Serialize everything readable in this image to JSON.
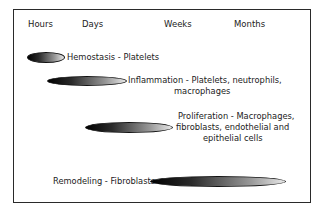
{
  "timeline": {
    "labels": [
      "Hours",
      "Days",
      "Weeks",
      "Months"
    ]
  },
  "phases": [
    {
      "name": "Hemostasis",
      "cells": "Platelets",
      "lines": [
        "Hemostasis - Platelets"
      ]
    },
    {
      "name": "Inflammation",
      "cells": "Platelets, neutrophils, macrophages",
      "lines": [
        "Inflammation - Platelets, neutrophils,",
        "macrophages"
      ]
    },
    {
      "name": "Proliferation",
      "cells": "Macrophages, fibroblasts, endothelial and epithelial cells",
      "lines": [
        "Proliferation - Macrophages,",
        "fibroblasts, endothelial and",
        "epithelial cells"
      ]
    },
    {
      "name": "Remodeling",
      "cells": "Fibroblasts",
      "lines": [
        "Remodeling - Fibroblasts"
      ]
    }
  ]
}
